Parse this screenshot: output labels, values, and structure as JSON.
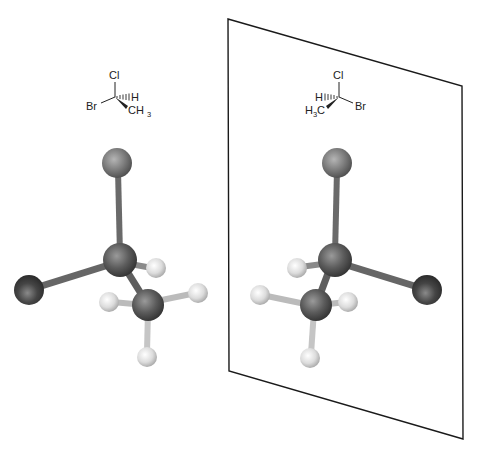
{
  "colors": {
    "background": "#ffffff",
    "mirror_line": "#1a1a1a",
    "chlorine": "#7a7a7a",
    "carbon": "#555555",
    "bromine": "#3c3c3c",
    "hydrogen": "#d9d9d9",
    "bond": "#6a6a6a",
    "text": "#222222"
  },
  "left_structure": {
    "top": "Cl",
    "left": "Br",
    "hashed": "H",
    "wedge": "CH",
    "wedge_sub": "3"
  },
  "right_structure": {
    "top": "Cl",
    "right": "Br",
    "hashed": "H",
    "wedge_pre": "H",
    "wedge_sub": "3",
    "wedge_post": "C"
  },
  "mirror_plane": {
    "corners": [
      [
        228,
        19
      ],
      [
        462,
        86
      ],
      [
        463,
        439
      ],
      [
        229,
        371
      ]
    ]
  }
}
